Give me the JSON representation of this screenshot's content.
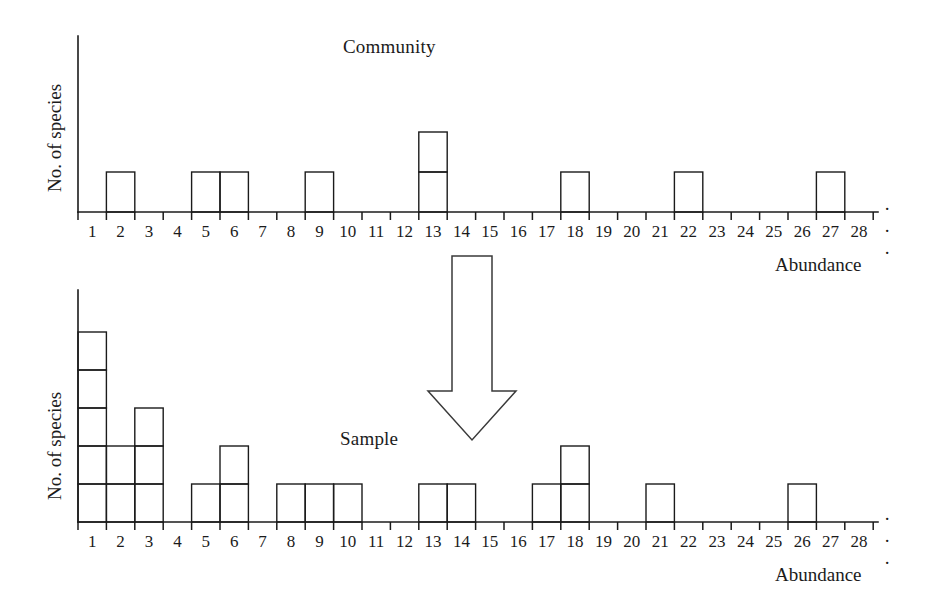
{
  "figure": {
    "background_color": "#ffffff",
    "ink_color": "#1b1b1b",
    "ellipsis_top": "· · ·",
    "ellipsis_bottom": "· · ·",
    "arrow_label": "down-arrow-community-to-sample"
  },
  "chart_data": [
    {
      "type": "bar",
      "title": "Community",
      "xlabel": "Abundance",
      "ylabel": "No. of species",
      "categories": [
        1,
        2,
        3,
        4,
        5,
        6,
        7,
        8,
        9,
        10,
        11,
        12,
        13,
        14,
        15,
        16,
        17,
        18,
        19,
        20,
        21,
        22,
        23,
        24,
        25,
        26,
        27,
        28
      ],
      "values": [
        0,
        1,
        0,
        0,
        1,
        1,
        0,
        0,
        1,
        0,
        0,
        0,
        2,
        0,
        0,
        0,
        0,
        1,
        0,
        0,
        0,
        1,
        0,
        0,
        0,
        0,
        1,
        0
      ],
      "xlim": [
        0,
        28
      ],
      "ylim": [
        0,
        3
      ],
      "grid": false,
      "legend": "none",
      "axis_truncated": true
    },
    {
      "type": "bar",
      "title": "Sample",
      "xlabel": "Abundance",
      "ylabel": "No. of species",
      "categories": [
        1,
        2,
        3,
        4,
        5,
        6,
        7,
        8,
        9,
        10,
        11,
        12,
        13,
        14,
        15,
        16,
        17,
        18,
        19,
        20,
        21,
        22,
        23,
        24,
        25,
        26,
        27,
        28
      ],
      "values": [
        5,
        2,
        3,
        0,
        1,
        2,
        0,
        1,
        1,
        1,
        0,
        0,
        1,
        1,
        0,
        0,
        1,
        2,
        0,
        0,
        1,
        0,
        0,
        0,
        0,
        1,
        0,
        0
      ],
      "xlim": [
        0,
        28
      ],
      "ylim": [
        0,
        6
      ],
      "grid": false,
      "legend": "none",
      "axis_truncated": true
    }
  ]
}
